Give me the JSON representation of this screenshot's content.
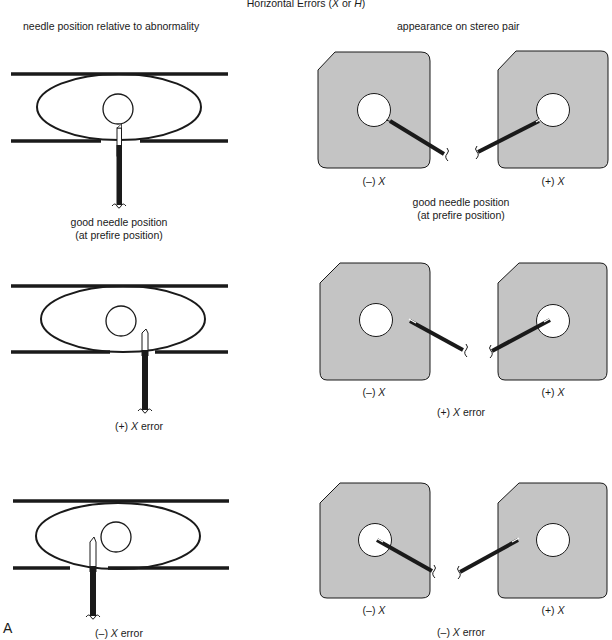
{
  "title": {
    "prefix": "Horizontal Errors (",
    "x": "X",
    "or": " or ",
    "h": "H",
    "suffix": ")"
  },
  "column_headers": {
    "left": "needle position relative to abnormality",
    "right": "appearance on stereo pair"
  },
  "rows": [
    {
      "left_caption_line1": "good needle position",
      "left_caption_line2": "(at prefire position)",
      "stereo_left_label_sign": "(–) ",
      "stereo_left_label_var": "X",
      "stereo_right_label_sign": "(+) ",
      "stereo_right_label_var": "X",
      "right_caption_line1": "good needle position",
      "right_caption_line2": "(at prefire position)"
    },
    {
      "left_caption_sign": "(+) ",
      "left_caption_var": "X",
      "left_caption_rest": " error",
      "stereo_left_label_sign": "(–) ",
      "stereo_left_label_var": "X",
      "stereo_right_label_sign": "(+) ",
      "stereo_right_label_var": "X",
      "right_caption_sign": "(+) ",
      "right_caption_var": "X",
      "right_caption_rest": " error"
    },
    {
      "left_caption_sign": "(–) ",
      "left_caption_var": "X",
      "left_caption_rest": " error",
      "stereo_left_label_sign": "(–) ",
      "stereo_left_label_var": "X",
      "stereo_right_label_sign": "(+) ",
      "stereo_right_label_var": "X",
      "right_caption_sign": "(–) ",
      "right_caption_var": "X",
      "right_caption_rest": " error"
    }
  ],
  "panel_letter": "A",
  "colors": {
    "ink": "#1a1a1a",
    "film_gray": "#c4c4c4",
    "background": "#ffffff"
  }
}
